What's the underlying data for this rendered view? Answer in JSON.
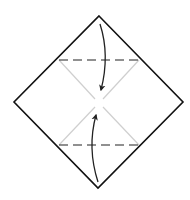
{
  "diagram": {
    "type": "origami-fold-step",
    "colors": {
      "background": "#ffffff",
      "outline": "#111111",
      "crease": "#cfcfcf",
      "fold_line": "#222222",
      "arrow": "#222222"
    },
    "paper": {
      "shape": "diamond",
      "vertices": {
        "top": [
          99,
          16
        ],
        "right": [
          183,
          102
        ],
        "bottom": [
          98,
          188
        ],
        "left": [
          14,
          102
        ]
      }
    },
    "center": [
      99,
      103
    ],
    "fold_lines": [
      {
        "name": "top-valley-fold",
        "style": "dashed",
        "from": [
          59,
          60
        ],
        "to": [
          139,
          60
        ]
      },
      {
        "name": "bottom-valley-fold",
        "style": "dashed",
        "from": [
          59,
          145
        ],
        "to": [
          139,
          145
        ]
      }
    ],
    "creases": [
      {
        "name": "crease-upper-left",
        "from": [
          59,
          60
        ],
        "to": [
          95,
          99
        ]
      },
      {
        "name": "crease-upper-right",
        "from": [
          139,
          60
        ],
        "to": [
          103,
          99
        ]
      },
      {
        "name": "crease-lower-left",
        "from": [
          59,
          145
        ],
        "to": [
          95,
          107
        ]
      },
      {
        "name": "crease-lower-right",
        "from": [
          139,
          145
        ],
        "to": [
          103,
          107
        ]
      }
    ],
    "arrows": [
      {
        "name": "fold-top-down-arrow",
        "direction": "down",
        "start": [
          100,
          24
        ],
        "control": [
          110,
          55
        ],
        "end": [
          101,
          90
        ]
      },
      {
        "name": "fold-bottom-up-arrow",
        "direction": "up",
        "start": [
          98,
          182
        ],
        "control": [
          87,
          148
        ],
        "end": [
          96,
          115
        ]
      }
    ]
  }
}
